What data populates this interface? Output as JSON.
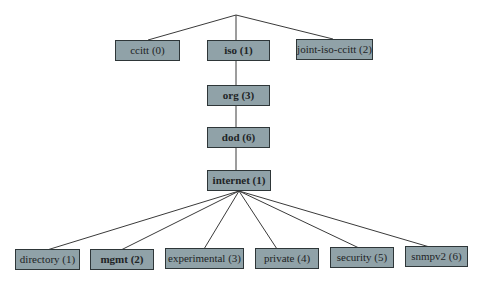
{
  "diagram": {
    "title": "",
    "root": {
      "id": "root",
      "label": ""
    },
    "nodes": [
      {
        "id": "ccitt",
        "label": "ccitt (0)",
        "bold": false,
        "parent": "root"
      },
      {
        "id": "iso",
        "label": "iso (1)",
        "bold": true,
        "parent": "root"
      },
      {
        "id": "joint-iso-ccitt",
        "label": "joint-iso-ccitt (2)",
        "bold": false,
        "parent": "root"
      },
      {
        "id": "org",
        "label": "org (3)",
        "bold": true,
        "parent": "iso"
      },
      {
        "id": "dod",
        "label": "dod (6)",
        "bold": true,
        "parent": "org"
      },
      {
        "id": "internet",
        "label": "internet (1)",
        "bold": true,
        "parent": "dod"
      },
      {
        "id": "directory",
        "label": "directory (1)",
        "bold": false,
        "parent": "internet"
      },
      {
        "id": "mgmt",
        "label": "mgmt (2)",
        "bold": true,
        "parent": "internet"
      },
      {
        "id": "experimental",
        "label": "experimental (3)",
        "bold": false,
        "parent": "internet"
      },
      {
        "id": "private",
        "label": "private (4)",
        "bold": false,
        "parent": "internet"
      },
      {
        "id": "security",
        "label": "security (5)",
        "bold": false,
        "parent": "internet"
      },
      {
        "id": "snmpv2",
        "label": "snmpv2 (6)",
        "bold": false,
        "parent": "internet"
      }
    ],
    "colors": {
      "node_fill": "#90a2a8",
      "node_border": "#2e3638",
      "edge": "#3a3a3a",
      "text": "#1e2426"
    }
  }
}
